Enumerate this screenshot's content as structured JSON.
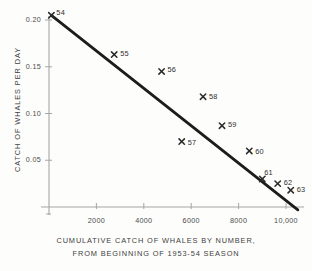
{
  "chart_data": {
    "type": "scatter",
    "title": "",
    "xlabel": "CUMULATIVE CATCH OF WHALES BY NUMBER, FROM BEGINNING OF 1953-54 SEASON",
    "ylabel": "CATCH OF WHALES PER DAY",
    "xlim": [
      0,
      10600
    ],
    "ylim": [
      0,
      0.215
    ],
    "grid": false,
    "legend": null,
    "xticks": [
      2000,
      4000,
      6000,
      8000,
      10000
    ],
    "xtick_labels": [
      "2000",
      "4000",
      "6000",
      "8000",
      "10,000"
    ],
    "yticks": [
      0.05,
      0.1,
      0.15,
      0.2
    ],
    "ytick_labels": [
      "0.05",
      "0.10",
      "0.15",
      "0.20"
    ],
    "marker": "x",
    "points": [
      {
        "label": "54",
        "x": 100,
        "y": 0.205
      },
      {
        "label": "55",
        "x": 2750,
        "y": 0.163
      },
      {
        "label": "56",
        "x": 4750,
        "y": 0.145
      },
      {
        "label": "57",
        "x": 5600,
        "y": 0.07
      },
      {
        "label": "58",
        "x": 6500,
        "y": 0.118
      },
      {
        "label": "59",
        "x": 7300,
        "y": 0.087
      },
      {
        "label": "60",
        "x": 8450,
        "y": 0.06
      },
      {
        "label": "61",
        "x": 9000,
        "y": 0.03
      },
      {
        "label": "62",
        "x": 9650,
        "y": 0.025
      },
      {
        "label": "63",
        "x": 10200,
        "y": 0.018
      }
    ],
    "trend_line": {
      "name": "fitted regression line",
      "x_start": 100,
      "y_start": 0.205,
      "x_end": 10500,
      "y_end": -0.003
    }
  },
  "caption": {
    "line1": "CUMULATIVE CATCH OF WHALES BY NUMBER,",
    "line2": "FROM BEGINNING OF 1953-54 SEASON"
  },
  "axes": {
    "y_axis_title": "CATCH OF WHALES PER DAY"
  },
  "colors": {
    "axis": "#9a9a9a",
    "line": "#1c1c1c",
    "marker": "#2a2a2a",
    "text": "#3d3d3d",
    "background": "#fdfdfc"
  }
}
